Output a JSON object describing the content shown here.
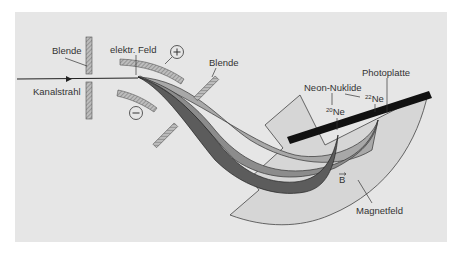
{
  "diagram": {
    "labels": {
      "blende_left": "Blende",
      "blende_right": "Blende",
      "elektr_feld": "elektr. Feld",
      "kanalstrahl": "Kanalstrahl",
      "plus_sign": "+",
      "minus_sign": "−",
      "photoplatte": "Photoplatte",
      "neon_nuklide": "Neon-Nuklide",
      "ne20_mass": "20",
      "ne20_symbol": "Ne",
      "ne22_mass": "22",
      "ne22_symbol": "Ne",
      "b_field": "B",
      "b_arrow": "→",
      "magnetfeld": "Magnetfeld"
    },
    "colors": {
      "background": "#e6e6e6",
      "magnet_field": "#d4d4d4",
      "beam_light": "#a9a9a9",
      "beam_mid": "#8a8a8a",
      "beam_dark": "#5a5a5a",
      "photoplate": "#111111",
      "plate_hatch": "#9a9a9a",
      "line": "#333333"
    }
  }
}
